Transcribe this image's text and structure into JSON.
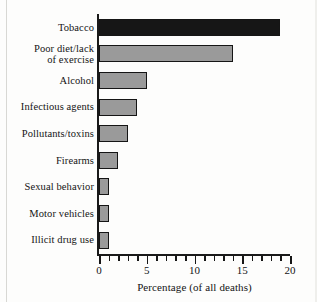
{
  "chart_data": {
    "type": "bar",
    "orientation": "horizontal",
    "title": "",
    "subtitle": "",
    "xlabel": "Percentage (of all deaths)",
    "ylabel": "",
    "categories": [
      "Tobacco",
      "Poor diet/lack of exercise",
      "Alcohol",
      "Infectious agents",
      "Pollutants/toxins",
      "Firearms",
      "Sexual behavior",
      "Motor vehicles",
      "Illicit drug use"
    ],
    "values": [
      19,
      14,
      5,
      4,
      3,
      2,
      1,
      1,
      1
    ],
    "xlim": [
      0,
      20
    ],
    "xticks": [
      0,
      5,
      10,
      15,
      20
    ],
    "xtick_labels": [
      "0",
      "5",
      "10",
      "15",
      "20"
    ],
    "minor_tick_interval": 1,
    "grid": false,
    "legend": false,
    "bar_colors": [
      "#161616",
      "#9a9a9a",
      "#9a9a9a",
      "#9a9a9a",
      "#9a9a9a",
      "#9a9a9a",
      "#9a9a9a",
      "#9a9a9a",
      "#9a9a9a"
    ],
    "bar_edge_color": "#151515"
  },
  "labels": {
    "row0": "Tobacco",
    "row1_line1": "Poor diet/lack",
    "row1_line2": "of exercise",
    "row2": "Alcohol",
    "row3": "Infectious agents",
    "row4": "Pollutants/toxins",
    "row5": "Firearms",
    "row6": "Sexual behavior",
    "row7": "Motor vehicles",
    "row8": "Illicit drug use"
  },
  "axis": {
    "x_title": "Percentage (of all deaths)",
    "tick0": "0",
    "tick1": "5",
    "tick2": "10",
    "tick3": "15",
    "tick4": "20"
  }
}
